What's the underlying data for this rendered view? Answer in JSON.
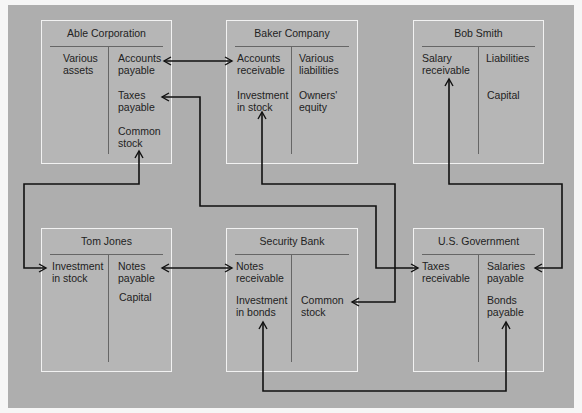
{
  "colors": {
    "background": "#aeaeae",
    "box_fill": "#b6b6b6",
    "box_border": "#f2f2f2",
    "connector": "#111111"
  },
  "accounts": [
    {
      "name": "Able Corporation",
      "debits": [
        "Various\nassets"
      ],
      "credits": [
        "Accounts\npayable",
        "Taxes\npayable",
        "Common\nstock"
      ]
    },
    {
      "name": "Baker Company",
      "debits": [
        "Accounts\nreceivable",
        "Investment\nin stock"
      ],
      "credits": [
        "Various\nliabilities",
        "Owners'\nequity"
      ]
    },
    {
      "name": "Bob Smith",
      "debits": [
        "Salary\nreceivable"
      ],
      "credits": [
        "Liabilities",
        "Capital"
      ]
    },
    {
      "name": "Tom Jones",
      "debits": [
        "Investment\nin stock"
      ],
      "credits": [
        "Notes\npayable",
        "Capital"
      ]
    },
    {
      "name": "Security Bank",
      "debits": [
        "Notes\nreceivable",
        "Investment\nin bonds"
      ],
      "credits": [
        "Common\nstock"
      ]
    },
    {
      "name": "U.S. Government",
      "debits": [
        "Taxes\nreceivable"
      ],
      "credits": [
        "Salaries\npayable",
        "Bonds\npayable"
      ]
    }
  ],
  "connections": [
    {
      "from": "Able Corporation: Accounts payable",
      "to": "Baker Company: Accounts receivable",
      "type": "double-arrow"
    },
    {
      "from": "Able Corporation: Common stock",
      "to": "Tom Jones: Investment in stock",
      "type": "double-arrow"
    },
    {
      "from": "Able Corporation: Taxes payable",
      "to": "U.S. Government: Taxes receivable",
      "type": "double-arrow"
    },
    {
      "from": "Baker Company: Investment in stock",
      "to": "Security Bank: Common stock",
      "type": "double-arrow"
    },
    {
      "from": "Bob Smith: Salary receivable",
      "to": "U.S. Government: Salaries payable",
      "type": "double-arrow"
    },
    {
      "from": "Tom Jones: Notes payable",
      "to": "Security Bank: Notes receivable",
      "type": "double-arrow"
    },
    {
      "from": "Security Bank: Investment in bonds",
      "to": "U.S. Government: Bonds payable",
      "type": "double-arrow"
    }
  ]
}
